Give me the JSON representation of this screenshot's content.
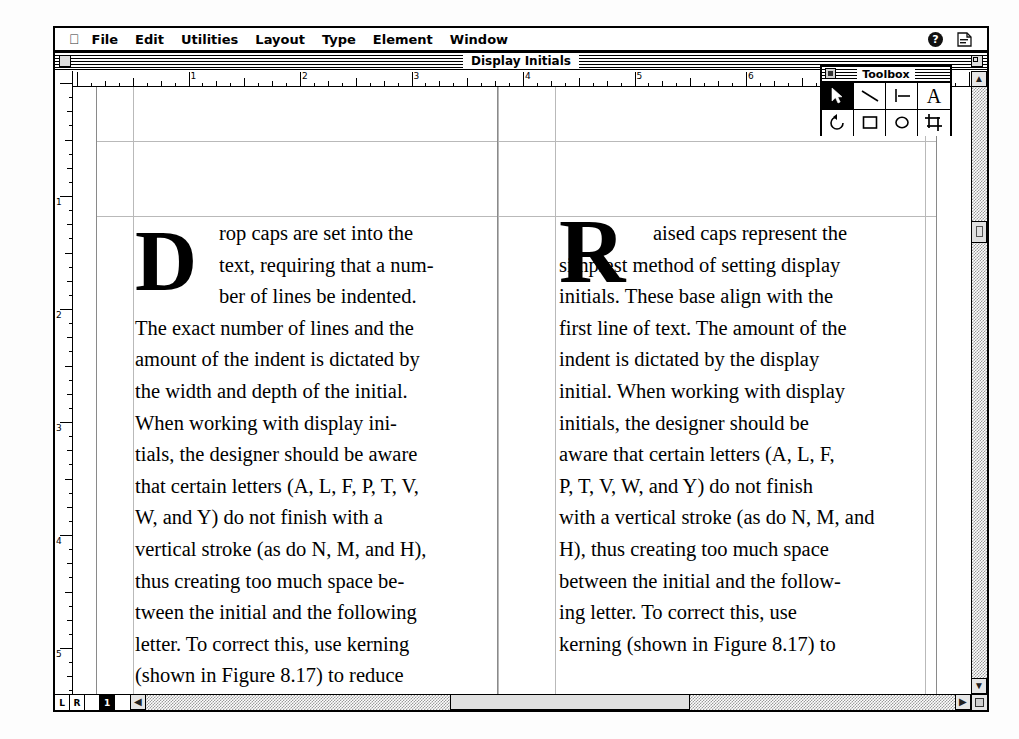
{
  "app": {
    "name": "PageMaker",
    "menubar": {
      "apple_icon": "apple-icon",
      "items": [
        "File",
        "Edit",
        "Utilities",
        "Layout",
        "Type",
        "Element",
        "Window"
      ],
      "help_icon_label": "?",
      "application_icon": "application-menu-icon"
    }
  },
  "window": {
    "title": "Display Initials",
    "close_box": "close-box",
    "zoom_box": "zoom-box"
  },
  "rulers": {
    "unit": "inches",
    "horizontal_labels": [
      "1",
      "2",
      "3",
      "4",
      "5",
      "6",
      "7",
      "8"
    ],
    "vertical_labels": [
      "1",
      "2",
      "3",
      "4",
      "5"
    ]
  },
  "toolbox": {
    "title": "Toolbox",
    "close_box": "close-box",
    "tools": [
      {
        "name": "pointer-tool",
        "icon": "arrow-pointer-icon",
        "selected": true
      },
      {
        "name": "diagonal-line-tool",
        "icon": "diagonal-line-icon",
        "selected": false
      },
      {
        "name": "constrained-line-tool",
        "icon": "perpendicular-line-icon",
        "selected": false
      },
      {
        "name": "text-tool",
        "icon": "letter-a-icon",
        "selected": false
      },
      {
        "name": "rotate-tool",
        "icon": "rotate-arrow-icon",
        "selected": false
      },
      {
        "name": "rectangle-tool",
        "icon": "rectangle-icon",
        "selected": false
      },
      {
        "name": "ellipse-tool",
        "icon": "ellipse-icon",
        "selected": false
      },
      {
        "name": "cropping-tool",
        "icon": "crop-icon",
        "selected": false
      }
    ]
  },
  "document": {
    "columns": [
      {
        "id": "left-column",
        "initial_style": "drop-cap",
        "initial_letter": "D",
        "lines": [
          "rop caps are set into the",
          "text, requiring that a num-",
          "ber of lines be indented.",
          "The exact number of lines and the",
          "amount of the indent is dictated by",
          "the width and depth of the initial.",
          "When working with display ini-",
          "tials, the designer should be aware",
          "that certain letters (A, L, F, P, T, V,",
          "W, and Y) do not finish with a",
          "vertical stroke (as do N, M, and H),",
          "thus creating too much space be-",
          "tween the initial and the following",
          "letter. To correct this, use kerning",
          "(shown in Figure 8.17) to reduce",
          "the space."
        ]
      },
      {
        "id": "right-column",
        "initial_style": "raised-cap",
        "initial_letter": "R",
        "lines": [
          "aised caps represent the",
          "simplest method of setting display",
          "initials. These base align with the",
          "first line of text. The amount of the",
          "indent is dictated by the display",
          "initial. When working with display",
          "initials, the designer should be",
          "aware that certain letters (A, L, F,",
          "P, T, V, W, and Y) do not finish",
          "with a vertical stroke (as do N, M, and",
          "H), thus creating too much space",
          "between the initial and the follow-",
          "ing letter. To correct this, use",
          "kerning (shown in Figure 8.17) to"
        ]
      }
    ]
  },
  "pagebar": {
    "master_left": "L",
    "master_right": "R",
    "pages": [
      {
        "label": "1",
        "active": true
      }
    ]
  },
  "scrollbars": {
    "up_arrow": "▲",
    "down_arrow": "▼",
    "left_arrow": "◀",
    "right_arrow": "▶",
    "resize_grip": "resize-grip"
  },
  "colors": {
    "frame": "#000000",
    "paper": "#ffffff",
    "guide": "#b9b9b9",
    "scroll_track": "#9a9a9a"
  }
}
